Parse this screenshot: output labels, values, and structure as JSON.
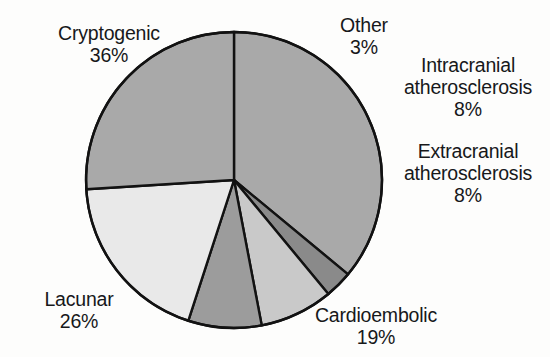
{
  "figure": {
    "background_color": "#fdfdfc",
    "stroke_color": "#121212",
    "text_color": "#17181a"
  },
  "chart_data": {
    "type": "pie",
    "title": "",
    "subtitle": "",
    "xlabel": "",
    "ylabel": "",
    "legend_position": "none",
    "grid": false,
    "units": "percent",
    "total": 100,
    "start_angle_deg": 0,
    "direction": "clockwise",
    "center": {
      "x": 234,
      "y": 180
    },
    "radius": 148,
    "categories": [
      "Cryptogenic",
      "Other",
      "Intracranial atherosclerosis",
      "Extracranial atherosclerosis",
      "Cardioembolic",
      "Lacunar"
    ],
    "values": [
      36,
      3,
      8,
      8,
      19,
      26
    ],
    "value_labels": [
      "36%",
      "3%",
      "8%",
      "8%",
      "19%",
      "26%"
    ],
    "colors": [
      "#a9a9a9",
      "#8a8a8a",
      "#c9c9c9",
      "#9c9c9c",
      "#e9e9e9",
      "#a9a9a9"
    ],
    "slices": [
      {
        "id": "cryptogenic",
        "name": "Cryptogenic",
        "name_lines": [
          "Cryptogenic"
        ],
        "value": 36,
        "value_label": "36%",
        "color": "#a9a9a9",
        "start_deg": 0,
        "end_deg": 129.6
      },
      {
        "id": "other",
        "name": "Other",
        "name_lines": [
          "Other"
        ],
        "value": 3,
        "value_label": "3%",
        "color": "#8a8a8a",
        "start_deg": 129.6,
        "end_deg": 140.4
      },
      {
        "id": "intracranial-atherosclerosis",
        "name": "Intracranial atherosclerosis",
        "name_lines": [
          "Intracranial",
          "atherosclerosis"
        ],
        "value": 8,
        "value_label": "8%",
        "color": "#c9c9c9",
        "start_deg": 140.4,
        "end_deg": 169.2
      },
      {
        "id": "extracranial-atherosclerosis",
        "name": "Extracranial atherosclerosis",
        "name_lines": [
          "Extracranial",
          "atherosclerosis"
        ],
        "value": 8,
        "value_label": "8%",
        "color": "#9c9c9c",
        "start_deg": 169.2,
        "end_deg": 198.0
      },
      {
        "id": "cardioembolic",
        "name": "Cardioembolic",
        "name_lines": [
          "Cardioembolic"
        ],
        "value": 19,
        "value_label": "19%",
        "color": "#e9e9e9",
        "start_deg": 198.0,
        "end_deg": 266.4
      },
      {
        "id": "lacunar",
        "name": "Lacunar",
        "name_lines": [
          "Lacunar"
        ],
        "value": 26,
        "value_label": "26%",
        "color": "#a9a9a9",
        "start_deg": 266.4,
        "end_deg": 360.0
      }
    ]
  },
  "labels": {
    "cryptogenic": {
      "name": "Cryptogenic",
      "value": "36%"
    },
    "other": {
      "name": "Other",
      "value": "3%"
    },
    "intracranial": {
      "line1": "Intracranial",
      "line2": "atherosclerosis",
      "value": "8%"
    },
    "extracranial": {
      "line1": "Extracranial",
      "line2": "atherosclerosis",
      "value": "8%"
    },
    "cardioembolic": {
      "name": "Cardioembolic",
      "value": "19%"
    },
    "lacunar": {
      "name": "Lacunar",
      "value": "26%"
    }
  },
  "caption_sliver": {
    "text": ""
  }
}
